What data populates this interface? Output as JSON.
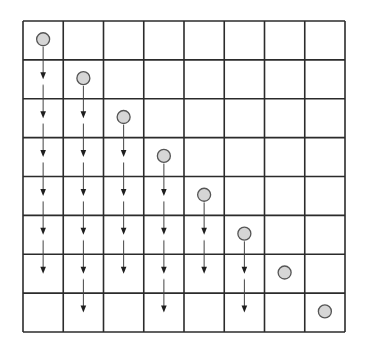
{
  "diagram": {
    "type": "grid-propagation",
    "rows": 8,
    "cols": 8,
    "grid": {
      "x0": 23,
      "y0": 21,
      "width": 322,
      "height": 311,
      "line_color": "#2b2b2b"
    },
    "node_style": {
      "fill": "#d6d6d6",
      "stroke": "#555555",
      "radius": 6.5
    },
    "nodes": [
      {
        "row": 1,
        "col": 1
      },
      {
        "row": 2,
        "col": 2
      },
      {
        "row": 3,
        "col": 3
      },
      {
        "row": 4,
        "col": 4
      },
      {
        "row": 5,
        "col": 5
      },
      {
        "row": 6,
        "col": 6
      },
      {
        "row": 7,
        "col": 7
      },
      {
        "row": 8,
        "col": 8
      }
    ],
    "arrow_columns": [
      {
        "col": 1,
        "from_row": 2,
        "to_row": 7
      },
      {
        "col": 2,
        "from_row": 3,
        "to_row": 8
      },
      {
        "col": 3,
        "from_row": 4,
        "to_row": 7
      },
      {
        "col": 4,
        "from_row": 5,
        "to_row": 8
      },
      {
        "col": 5,
        "from_row": 6,
        "to_row": 7
      },
      {
        "col": 6,
        "from_row": 7,
        "to_row": 8
      }
    ],
    "arrow_direction": "down",
    "icons": {
      "node": "circle-node-icon",
      "arrow": "arrow-down-icon"
    }
  }
}
